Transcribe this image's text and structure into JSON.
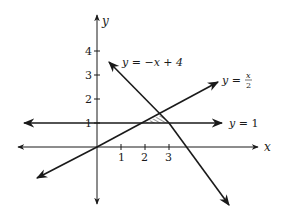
{
  "figure": {
    "axes": {
      "x_label": "x",
      "y_label": "y"
    },
    "x_ticks": [
      "1",
      "2",
      "3"
    ],
    "y_ticks": [
      "1",
      "2",
      "3",
      "4"
    ],
    "lines": [
      {
        "id": "line-neg",
        "label_prefix": "y = ",
        "label_expr": "−x + 4"
      },
      {
        "id": "line-half",
        "label_prefix": "y = ",
        "label_num": "x",
        "label_den": "2"
      },
      {
        "id": "line-one",
        "label_prefix": "y = ",
        "label_expr": "1"
      }
    ],
    "shaded_region": "triangle bounded by y = 1, y = x/2, y = −x + 4",
    "colors": {
      "ink": "#1a1a1a",
      "background": "#ffffff"
    }
  }
}
